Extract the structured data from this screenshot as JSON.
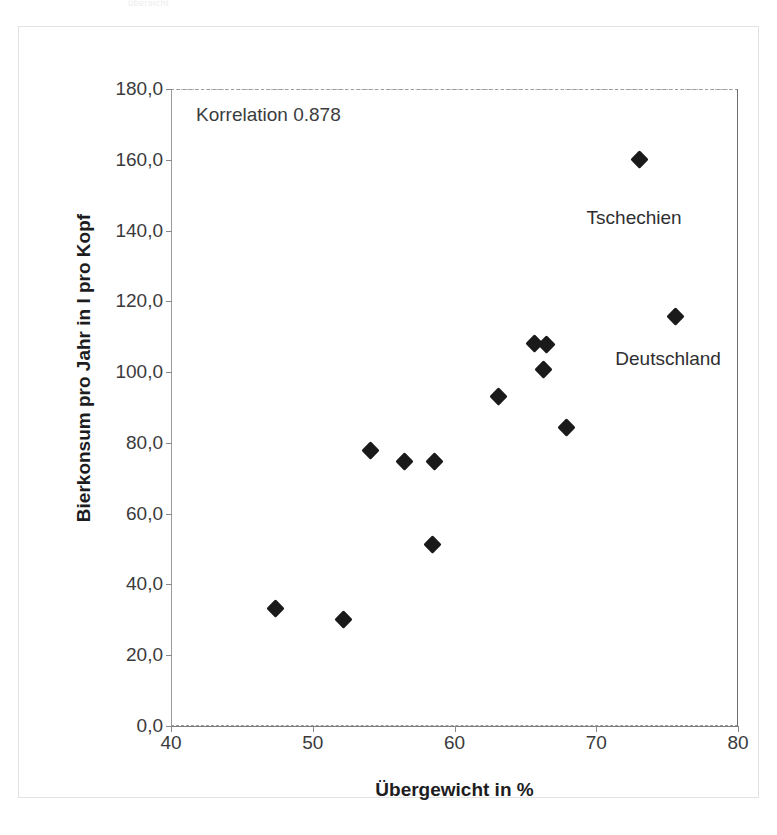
{
  "figure": {
    "scan_top_fragment": "übersicht",
    "annotation": "Korrelation 0.878"
  },
  "chart_data": {
    "type": "scatter",
    "title": "",
    "xlabel": "Übergewicht in %",
    "ylabel": "Bierkonsum pro Jahr in l pro Kopf",
    "xlim": [
      40,
      80
    ],
    "ylim": [
      0,
      180
    ],
    "xticks": [
      "40",
      "50",
      "60",
      "70",
      "80"
    ],
    "xtick_values": [
      40,
      50,
      60,
      70,
      80
    ],
    "yticks": [
      "0,0",
      "20,0",
      "40,0",
      "60,0",
      "80,0",
      "100,0",
      "120,0",
      "140,0",
      "160,0",
      "180,0"
    ],
    "ytick_values": [
      0,
      20,
      40,
      60,
      80,
      100,
      120,
      140,
      160,
      180
    ],
    "grid": false,
    "legend": "none",
    "correlation": 0.878,
    "annotations": [
      {
        "text": "Korrelation 0.878",
        "x": 41.2,
        "y": 174.0
      }
    ],
    "points": [
      {
        "x": 47.3,
        "y": 33.5,
        "label": ""
      },
      {
        "x": 52.1,
        "y": 30.5,
        "label": ""
      },
      {
        "x": 54.0,
        "y": 78.0,
        "label": ""
      },
      {
        "x": 56.4,
        "y": 75.0,
        "label": ""
      },
      {
        "x": 58.5,
        "y": 75.0,
        "label": ""
      },
      {
        "x": 58.4,
        "y": 51.5,
        "label": ""
      },
      {
        "x": 63.0,
        "y": 93.5,
        "label": ""
      },
      {
        "x": 65.6,
        "y": 108.5,
        "label": ""
      },
      {
        "x": 66.4,
        "y": 108.0,
        "label": ""
      },
      {
        "x": 66.2,
        "y": 101.0,
        "label": ""
      },
      {
        "x": 67.8,
        "y": 84.5,
        "label": ""
      },
      {
        "x": 73.0,
        "y": 160.5,
        "label": "Tschechien"
      },
      {
        "x": 75.5,
        "y": 116.0,
        "label": "Deutschland"
      }
    ],
    "point_labels": [
      {
        "text": "Tschechien",
        "x": 72.6,
        "y": 147.0
      },
      {
        "text": "Deutschland",
        "x": 75.0,
        "y": 107.0
      }
    ]
  },
  "colors": {
    "marker": "#1a1a1a",
    "axis": "#7d7d7f",
    "text": "#2e2e30",
    "frame": "#e3e3e4",
    "background": "#ffffff"
  }
}
